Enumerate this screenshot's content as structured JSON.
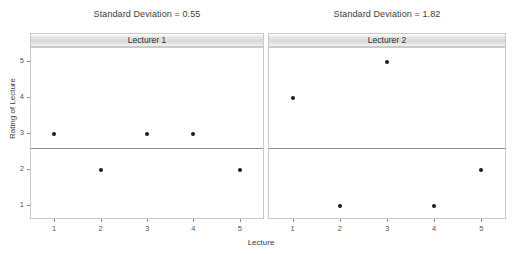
{
  "chart_data": {
    "type": "scatter",
    "title": "",
    "xlabel": "Lecture",
    "ylabel": "Rating of Lecture",
    "xlim": [
      0.5,
      5.5
    ],
    "ylim": [
      0.6,
      5.4
    ],
    "x": [
      1,
      2,
      3,
      4,
      5
    ],
    "xticks": [
      "1",
      "2",
      "3",
      "4",
      "5"
    ],
    "yticks": [
      "1",
      "2",
      "3",
      "4",
      "5"
    ],
    "ytick_values": [
      1,
      2,
      3,
      4,
      5
    ],
    "grid": false,
    "legend": "none",
    "facets": [
      {
        "strip_label": "Lecturer 1",
        "panel_title": "Standard Deviation = 0.55",
        "standard_deviation": 0.55,
        "values": [
          3,
          2,
          3,
          3,
          2
        ],
        "mean_line": 2.6
      },
      {
        "strip_label": "Lecturer 2",
        "panel_title": "Standard Deviation = 1.82",
        "standard_deviation": 1.82,
        "values": [
          4,
          1,
          5,
          1,
          2
        ],
        "mean_line": 2.6
      }
    ],
    "colors": {
      "point": "#1a1a1a",
      "reference_line": "#8c8c8c",
      "panel_border": "#c9c9c9",
      "strip_fill": "#d9d9d9",
      "background": "#ffffff",
      "text": "#3d3d3d"
    }
  }
}
